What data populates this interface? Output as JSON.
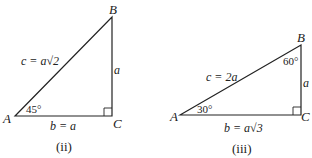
{
  "figures": [
    {
      "caption": "(ii)",
      "vertices": {
        "A": "A",
        "B": "B",
        "C": "C"
      },
      "hypotenuse_label": "c = a√2",
      "vertical_side_label": "a",
      "base_label": "b = a",
      "angle_A": "45°"
    },
    {
      "caption": "(iii)",
      "vertices": {
        "A": "A",
        "B": "B",
        "C": "C"
      },
      "hypotenuse_label": "c = 2a",
      "vertical_side_label": "a",
      "base_label": "b = a√3",
      "angle_A": "30°",
      "angle_B": "60°"
    }
  ],
  "colors": {
    "line": "#222222",
    "background": "#ffffff"
  }
}
